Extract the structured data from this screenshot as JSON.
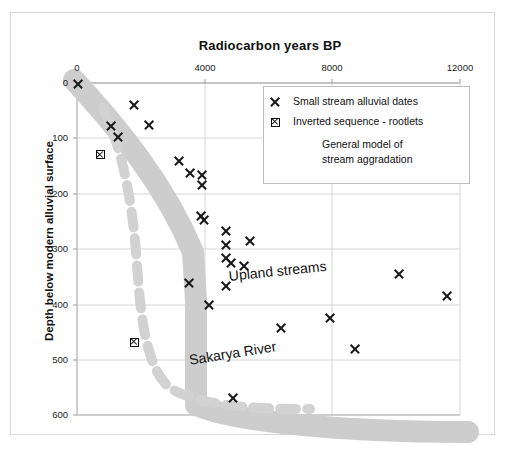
{
  "chart_data": {
    "type": "scatter",
    "title": "Radiocarbon years BP",
    "xlabel": "Radiocarbon years BP",
    "ylabel": "Depth below modern alluvial surface",
    "xlim": [
      0,
      12600
    ],
    "ylim": [
      0,
      600
    ],
    "y_inverted": true,
    "x_axis_position": "top",
    "grid": true,
    "xticks": [
      0,
      4000,
      8000,
      12000
    ],
    "xtick_labels": [
      "0",
      "4000",
      "8000",
      "12000"
    ],
    "yticks": [
      0,
      100,
      200,
      300,
      400,
      500,
      600
    ],
    "ytick_labels": [
      "0",
      "100",
      "200",
      "300",
      "400",
      "500",
      "600"
    ],
    "legend_position": "upper-right-inside",
    "series": [
      {
        "name": "Small stream alluvial dates",
        "marker": "x",
        "color": "#1a1a1a",
        "points": [
          {
            "x": 30,
            "y": 2
          },
          {
            "x": 1800,
            "y": 40
          },
          {
            "x": 1050,
            "y": 78
          },
          {
            "x": 2250,
            "y": 75
          },
          {
            "x": 1270,
            "y": 98
          },
          {
            "x": 3200,
            "y": 140
          },
          {
            "x": 3550,
            "y": 163
          },
          {
            "x": 3930,
            "y": 167
          },
          {
            "x": 3930,
            "y": 185
          },
          {
            "x": 3880,
            "y": 240
          },
          {
            "x": 3980,
            "y": 247
          },
          {
            "x": 4680,
            "y": 268
          },
          {
            "x": 4680,
            "y": 292
          },
          {
            "x": 5420,
            "y": 285
          },
          {
            "x": 4680,
            "y": 317
          },
          {
            "x": 4830,
            "y": 325
          },
          {
            "x": 5220,
            "y": 330
          },
          {
            "x": 3500,
            "y": 362
          },
          {
            "x": 4680,
            "y": 366
          },
          {
            "x": 4120,
            "y": 402
          },
          {
            "x": 6380,
            "y": 443
          },
          {
            "x": 7930,
            "y": 425
          },
          {
            "x": 10100,
            "y": 345
          },
          {
            "x": 11600,
            "y": 385
          },
          {
            "x": 8700,
            "y": 480
          },
          {
            "x": 4900,
            "y": 570
          }
        ]
      },
      {
        "name": "Inverted sequence - rootlets",
        "marker": "square",
        "color": "#111111",
        "points": [
          {
            "x": 730,
            "y": 130
          },
          {
            "x": 1800,
            "y": 468
          }
        ]
      },
      {
        "name": "General model of stream aggradation",
        "marker": "band",
        "color": "#cdcdcd",
        "description": "Thick grey band: steep descent from (0,0) to ~(4000,300), near-vertical to ~(4000,420), then sub-horizontal right to ~(12300,455)"
      },
      {
        "name": "Sakarya River",
        "marker": "dashed-band",
        "color": "#d2d2d2",
        "description": "Dashed grey curve descending from ~(650,90) steeply to ~(1900,500) then flattening right to ~(6300,545)"
      }
    ],
    "annotations": [
      {
        "text": "Upland streams",
        "x": 5100,
        "y": 360
      },
      {
        "text": "Sakarya River",
        "x": 3900,
        "y": 510
      }
    ],
    "legend_entries": [
      {
        "label": "Small stream alluvial dates",
        "marker": "x"
      },
      {
        "label": "Inverted sequence - rootlets",
        "marker": "square"
      },
      {
        "label": "General model of\nstream aggradation",
        "marker": "band"
      }
    ]
  },
  "title": {
    "text": "Radiocarbon years BP"
  },
  "axes": {
    "y_title": "Depth below modern alluvial surface",
    "x_tick_labels": [
      "0",
      "4000",
      "8000",
      "12000"
    ],
    "y_tick_labels": [
      "0",
      "100",
      "200",
      "300",
      "400",
      "500",
      "600"
    ]
  },
  "legend": {
    "entry1_label": "Small stream alluvial dates",
    "entry2_label": "Inverted sequence - rootlets",
    "entry3_line1": "General model of",
    "entry3_line2": "stream aggradation"
  },
  "annotations": {
    "upland": "Upland streams",
    "sakarya": "Sakarya River"
  },
  "colors": {
    "band": "#cdcdcd",
    "dashed": "#d2d2d2",
    "marker": "#1a1a1a",
    "grid": "#d6d6d6",
    "frame": "#d9d9d9"
  }
}
